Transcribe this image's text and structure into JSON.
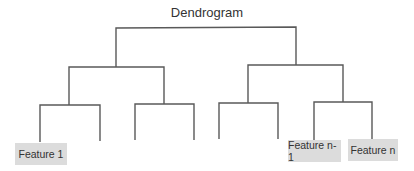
{
  "title": "Dendrogram",
  "colors": {
    "line": "#595959",
    "label_bg": "#dcdcdc",
    "text": "#333333"
  },
  "leaves": [
    {
      "label": "Feature 1",
      "x": 40
    },
    {
      "label": "",
      "x": 100
    },
    {
      "label": "",
      "x": 135
    },
    {
      "label": "",
      "x": 194
    },
    {
      "label": "",
      "x": 219
    },
    {
      "label": "",
      "x": 278
    },
    {
      "label": "Feature n-1",
      "x": 314
    },
    {
      "label": "Feature n",
      "x": 372
    }
  ],
  "labels": {
    "feature_1": "Feature 1",
    "feature_n_minus_1": "Feature n-1",
    "feature_n": "Feature n"
  }
}
